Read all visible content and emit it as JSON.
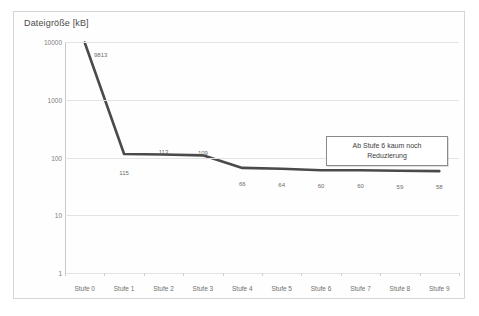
{
  "chart_data": {
    "type": "line",
    "title": "Dateigröße [kB]",
    "xlabel": "",
    "ylabel": "Dateigröße [kB]",
    "yscale": "log",
    "ylim": [
      1,
      10000
    ],
    "ytick_labels": [
      "10000",
      "1000",
      "100",
      "10",
      "1"
    ],
    "ytick_values": [
      10000,
      1000,
      100,
      10,
      1
    ],
    "grid": true,
    "legend": "none",
    "categories": [
      "Stufe 0",
      "Stufe 1",
      "Stufe 2",
      "Stufe 3",
      "Stufe 4",
      "Stufe 5",
      "Stufe 6",
      "Stufe 7",
      "Stufe 8",
      "Stufe 9"
    ],
    "values": [
      9813,
      115,
      113,
      109,
      66,
      64,
      60,
      60,
      59,
      58
    ],
    "point_labels": [
      "9813",
      "115",
      "113",
      "109",
      "66",
      "64",
      "60",
      "60",
      "59",
      "58"
    ],
    "series": [
      {
        "name": "Dateigröße",
        "color": "#4a4a4a",
        "values": [
          9813,
          115,
          113,
          109,
          66,
          64,
          60,
          60,
          59,
          58
        ]
      }
    ],
    "annotations": [
      {
        "text_line_1": "Ab Stufe 6 kaum noch",
        "text_line_2": "Reduzierung"
      }
    ]
  },
  "colors": {
    "line": "#4a4a4a",
    "grid": "#e3e3e3",
    "axis": "#c9c9c9",
    "text": "#6f6f6f",
    "box_border": "#8a8a8a",
    "page_border": "#d5d5d5"
  }
}
